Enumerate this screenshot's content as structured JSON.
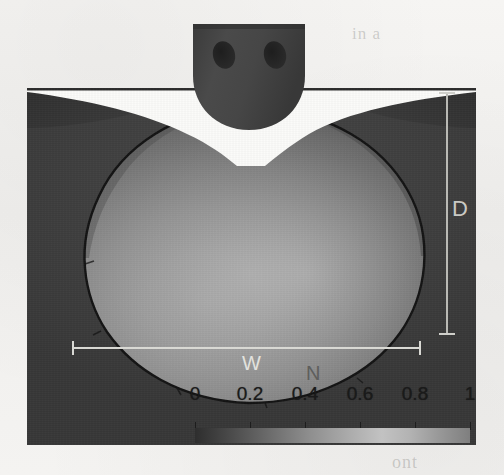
{
  "figure": {
    "type": "contour-cross-section"
  },
  "annotations": {
    "depth_label": "D",
    "width_label": "W",
    "field_label": "N"
  },
  "colorbar": {
    "ticks": [
      "0",
      "0.2",
      "0.4",
      "0.6",
      "0.8",
      "1"
    ],
    "tick_values": [
      0,
      0.2,
      0.4,
      0.6,
      0.8,
      1
    ],
    "orientation": "horizontal",
    "colormap": "grayscale",
    "low_color": "#2e2e2e",
    "high_color": "#c2c2c2"
  },
  "tool": {
    "name": "welding-tool-pin",
    "hole_count": 2
  },
  "ghost_text": {
    "top_right": "in a",
    "mid_right": "cros",
    "bottom_right": "ont"
  },
  "chart_data": {
    "type": "heatmap",
    "title": "",
    "xlabel": "",
    "ylabel": "",
    "legend": "N",
    "colorbar_label": "N",
    "colorbar_ticks": [
      0,
      0.2,
      0.4,
      0.6,
      0.8,
      1
    ],
    "colorbar_range": [
      0,
      1
    ],
    "annotations": [
      {
        "label": "D",
        "meaning": "weld depth",
        "orientation": "vertical"
      },
      {
        "label": "W",
        "meaning": "weld width",
        "orientation": "horizontal"
      },
      {
        "label": "N",
        "meaning": "normalized field value",
        "orientation": "legend"
      }
    ],
    "grid": false,
    "legend_position": "bottom"
  }
}
